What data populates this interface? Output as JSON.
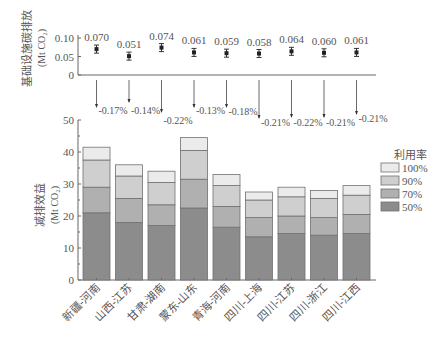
{
  "chart_data": [
    {
      "type": "scatter",
      "title": "",
      "ylabel": "基础设施碳排放 (Mt CO2)",
      "ylabel_lines": [
        "基础设施碳排放",
        "(Mt CO₂)"
      ],
      "ylim": [
        0,
        0.1
      ],
      "yticks": [
        "0",
        "0.05",
        "0.10"
      ],
      "categories": [
        "新疆-河南",
        "山西-江苏",
        "甘肃-湖南",
        "蒙东-山东",
        "青海-河南",
        "四川-上海",
        "四川-江苏",
        "四川-浙江",
        "四川-江西"
      ],
      "values": [
        0.07,
        0.051,
        0.074,
        0.061,
        0.059,
        0.058,
        0.064,
        0.06,
        0.061
      ],
      "labels": [
        "0.070",
        "0.051",
        "0.074",
        "0.061",
        "0.059",
        "0.058",
        "0.064",
        "0.060",
        "0.061"
      ],
      "error_bars": true,
      "grid": false
    },
    {
      "type": "bar",
      "stacked": true,
      "title": "",
      "ylabel": "减排效益 (Mt CO2)",
      "ylabel_lines": [
        "减排效益",
        "(Mt CO₂)"
      ],
      "ylim": [
        0,
        50
      ],
      "yticks": [
        "0",
        "10",
        "20",
        "30",
        "40",
        "50"
      ],
      "categories": [
        "新疆-河南",
        "山西-江苏",
        "甘肃-湖南",
        "蒙东-山东",
        "青海-河南",
        "四川-上海",
        "四川-江苏",
        "四川-浙江",
        "四川-江西"
      ],
      "legend_title": "利用率",
      "legend_position": "right",
      "series": [
        {
          "name": "50%",
          "color": "#8c8c8c",
          "values": [
            21.0,
            18.0,
            17.0,
            22.5,
            16.5,
            13.5,
            14.5,
            14.0,
            14.5
          ]
        },
        {
          "name": "70%",
          "color": "#b0b0b0",
          "values": [
            29.0,
            25.5,
            23.5,
            31.5,
            23.0,
            19.5,
            20.0,
            19.5,
            20.5
          ]
        },
        {
          "name": "90%",
          "color": "#cfcfcf",
          "values": [
            37.5,
            32.5,
            30.5,
            40.5,
            29.5,
            25.0,
            26.0,
            25.5,
            26.5
          ]
        },
        {
          "name": "100%",
          "color": "#ebebeb",
          "values": [
            41.5,
            36.0,
            34.0,
            44.5,
            33.0,
            27.5,
            29.0,
            28.0,
            29.5
          ]
        }
      ],
      "annotations": [
        "-0.17%",
        "-0.14%",
        "-0.22%",
        "-0.13%",
        "-0.18%",
        "-0.21%",
        "-0.22%",
        "-0.21%",
        "-0.21%"
      ],
      "grid": false
    }
  ],
  "colors": {
    "axis": "#666666",
    "text": "#555555",
    "bar_edge": "#707070"
  }
}
